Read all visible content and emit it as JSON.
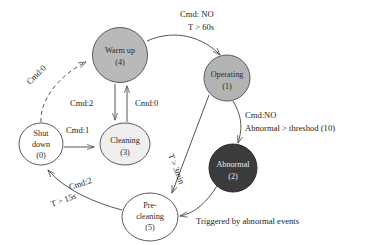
{
  "diagram": {
    "type": "state-machine",
    "nodes": [
      {
        "id": "warm-up",
        "label_line1": "Warm up",
        "label_line2": "(4)",
        "fill": "#b9b9b9",
        "text": "dark",
        "shape": "circle",
        "cx": 120,
        "cy": 55,
        "rx": 28,
        "ry": 27
      },
      {
        "id": "operating",
        "label_line1": "Operating",
        "label_line2": "(1)",
        "fill": "#b3b3b3",
        "text": "dark",
        "shape": "circle",
        "cx": 227,
        "cy": 78,
        "rx": 23,
        "ry": 23
      },
      {
        "id": "abnormal",
        "label_line1": "Abnormal",
        "label_line2": "(2)",
        "fill": "#3b3b3b",
        "text": "light",
        "shape": "circle",
        "cx": 233,
        "cy": 168,
        "rx": 24,
        "ry": 24
      },
      {
        "id": "pre-cleaning",
        "label_line1": "Pre-",
        "label_line2": "cleaning",
        "label_line3": "(5)",
        "fill": "#ffffff",
        "text": "dark",
        "shape": "circle",
        "cx": 150,
        "cy": 217,
        "rx": 28,
        "ry": 24
      },
      {
        "id": "cleaning",
        "label_line1": "Cleaning",
        "label_line2": "(3)",
        "fill": "#efefef",
        "text": "dark",
        "shape": "ellipse",
        "cx": 125,
        "cy": 144,
        "rx": 25,
        "ry": 21
      },
      {
        "id": "shut-down",
        "label_line1": "Shut",
        "label_line2": "down",
        "label_line3": "(0)",
        "fill": "#ffffff",
        "text": "dark",
        "shape": "ellipse",
        "cx": 41,
        "cy": 144,
        "rx": 22,
        "ry": 21
      }
    ],
    "edges": [
      {
        "id": "shutdown-to-warmup",
        "from": "shut-down",
        "to": "warm-up",
        "style": "dashed",
        "label": "Cmd:0"
      },
      {
        "id": "warmup-to-operating",
        "from": "warm-up",
        "to": "operating",
        "style": "solid",
        "label_line1": "Cmd: NO",
        "label_line2": "T >  60s"
      },
      {
        "id": "warmup-to-cleaning",
        "from": "warm-up",
        "to": "cleaning",
        "style": "solid",
        "label": "Cmd:2"
      },
      {
        "id": "cleaning-to-warmup",
        "from": "cleaning",
        "to": "warm-up",
        "style": "solid",
        "label": "Cmd:0"
      },
      {
        "id": "shutdown-to-cleaning",
        "from": "shut-down",
        "to": "cleaning",
        "style": "solid",
        "label": "Cmd:1"
      },
      {
        "id": "operating-to-abnormal",
        "from": "operating",
        "to": "abnormal",
        "style": "solid",
        "label_line1": "Cmd:NO",
        "label_line2": "Abnormal > threshod (10)"
      },
      {
        "id": "operating-to-precleaning",
        "from": "operating",
        "to": "pre-cleaning",
        "style": "solid",
        "label": "T > 3min"
      },
      {
        "id": "abnormal-to-precleaning",
        "from": "abnormal",
        "to": "pre-cleaning",
        "style": "solid",
        "label": "Triggered by abnormal events"
      },
      {
        "id": "precleaning-to-shutdown",
        "from": "pre-cleaning",
        "to": "shut-down",
        "style": "solid",
        "label_line1": "Cmd:2",
        "label_line2": "T > 15s"
      }
    ],
    "labels": {
      "cmd0_dashed": "Cmd:0",
      "cmd_no_60s_line1": "Cmd: NO",
      "cmd_no_60s_line2": "T >  60s",
      "cmd2_vertical": "Cmd:2",
      "cmd0_vertical": "Cmd:0",
      "cmd1": "Cmd:1",
      "cmd_no_abnormal_line1": "Cmd:NO",
      "cmd_no_abnormal_line2": "Abnormal > threshod (10)",
      "t_3min": "T > 3min",
      "cmd2_diag": "Cmd:2",
      "t_15s": "T > 15s",
      "triggered": "Triggered by abnormal events"
    },
    "colors": {
      "stroke": "#555555",
      "node_warmup": "#b9b9b9",
      "node_operating": "#b3b3b3",
      "node_abnormal": "#3b3b3b",
      "node_cleaning": "#efefef",
      "node_white": "#ffffff",
      "text_dark": "#242424",
      "text_light": "#e9e9e9"
    }
  }
}
